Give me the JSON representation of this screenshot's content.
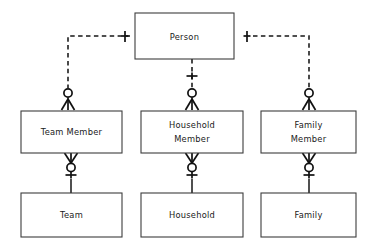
{
  "diagram": {
    "notation": "crows-foot",
    "background_color": "#ffffff",
    "line_color": "#161616",
    "box_stroke_color": "#3d3d3d",
    "text_color": "#1a1a1a",
    "entities": [
      {
        "id": "person",
        "label": "Person",
        "lines": [
          "Person"
        ],
        "x": 135,
        "y": 13,
        "width": 99,
        "height": 46
      },
      {
        "id": "team-member",
        "label": "Team Member",
        "lines": [
          "Team Member"
        ],
        "x": 21,
        "y": 111,
        "width": 101,
        "height": 42
      },
      {
        "id": "household-member",
        "label": "Household Member",
        "lines": [
          "Household",
          "Member"
        ],
        "x": 141,
        "y": 111,
        "width": 102,
        "height": 42
      },
      {
        "id": "family-member",
        "label": "Family Member",
        "lines": [
          "Family",
          "Member"
        ],
        "x": 261,
        "y": 111,
        "width": 95,
        "height": 42
      },
      {
        "id": "team",
        "label": "Team",
        "lines": [
          "Team"
        ],
        "x": 21,
        "y": 193,
        "width": 101,
        "height": 44
      },
      {
        "id": "household",
        "label": "Household",
        "lines": [
          "Household"
        ],
        "x": 141,
        "y": 193,
        "width": 102,
        "height": 44
      },
      {
        "id": "family",
        "label": "Family",
        "lines": [
          "Family"
        ],
        "x": 261,
        "y": 193,
        "width": 95,
        "height": 44
      }
    ],
    "relationships": [
      {
        "id": "person-team-member",
        "from": "person",
        "to": "team-member",
        "style": "dashed",
        "from_cardinality": "one",
        "to_cardinality": "zero-or-many",
        "from_symbol": "H",
        "to_symbol": "circle-crowsfoot"
      },
      {
        "id": "person-household-member",
        "from": "person",
        "to": "household-member",
        "style": "dashed",
        "from_cardinality": "one",
        "to_cardinality": "zero-or-many",
        "from_symbol": "H",
        "to_symbol": "circle-crowsfoot"
      },
      {
        "id": "person-family-member",
        "from": "person",
        "to": "family-member",
        "style": "dashed",
        "from_cardinality": "one",
        "to_cardinality": "zero-or-many",
        "from_symbol": "H",
        "to_symbol": "circle-crowsfoot"
      },
      {
        "id": "team-member-team",
        "from": "team-member",
        "to": "team",
        "style": "solid",
        "from_cardinality": "zero-or-many",
        "to_cardinality": "one",
        "from_symbol": "crowsfoot-circle",
        "to_symbol": "H"
      },
      {
        "id": "household-member-household",
        "from": "household-member",
        "to": "household",
        "style": "solid",
        "from_cardinality": "zero-or-many",
        "to_cardinality": "one",
        "from_symbol": "crowsfoot-circle",
        "to_symbol": "H"
      },
      {
        "id": "family-member-family",
        "from": "family-member",
        "to": "family",
        "style": "solid",
        "from_cardinality": "zero-or-many",
        "to_cardinality": "one",
        "from_symbol": "crowsfoot-circle",
        "to_symbol": "H"
      }
    ]
  }
}
